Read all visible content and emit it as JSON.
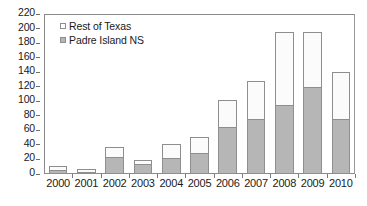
{
  "chart_data": {
    "type": "bar",
    "subtype": "stacked",
    "title": "",
    "xlabel": "",
    "ylabel": "",
    "categories": [
      "2000",
      "2001",
      "2002",
      "2003",
      "2004",
      "2005",
      "2006",
      "2007",
      "2008",
      "2009",
      "2010"
    ],
    "series": [
      {
        "name": "Padre Island NS",
        "color": "#b6b6b6",
        "values": [
          5,
          3,
          23,
          14,
          22,
          29,
          65,
          75,
          95,
          120,
          76
        ]
      },
      {
        "name": "Rest of Texas",
        "color": "#ffffff",
        "values": [
          7,
          5,
          15,
          6,
          20,
          23,
          38,
          54,
          102,
          77,
          65
        ]
      }
    ],
    "totals": [
      12,
      8,
      38,
      20,
      42,
      52,
      103,
      129,
      197,
      197,
      141
    ],
    "ylim": [
      0,
      220
    ],
    "ytick_step": 20,
    "yticks": [
      "0",
      "20",
      "40",
      "60",
      "80",
      "100",
      "120",
      "140",
      "160",
      "180",
      "200",
      "220"
    ],
    "grid": false,
    "legend_position": "top-left",
    "legend": [
      {
        "label": "Rest of Texas",
        "swatch": "white"
      },
      {
        "label": "Padre Island NS",
        "swatch": "gray"
      }
    ]
  }
}
